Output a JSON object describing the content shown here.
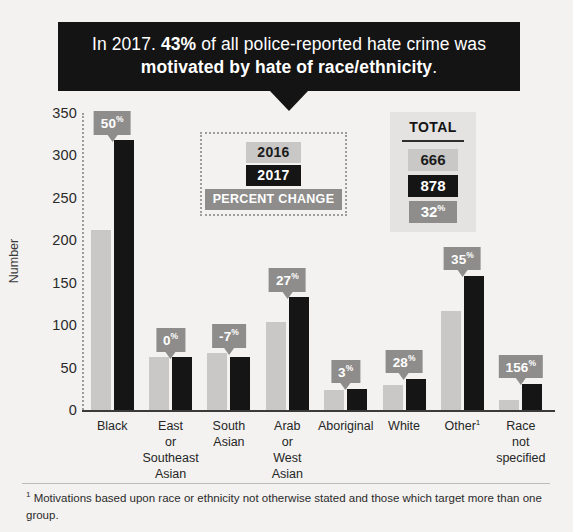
{
  "callout": {
    "part1": "In 2017. ",
    "bold1": "43%",
    "part2": " of all police-reported hate crime was ",
    "bold2": "motivated by hate of race/ethnicity",
    "part3": "."
  },
  "legend": {
    "prev_label": "2016",
    "curr_label": "2017",
    "change_label": "PERCENT CHANGE"
  },
  "total": {
    "title": "TOTAL",
    "prev": "666",
    "curr": "878",
    "change": "32",
    "change_unit": "%"
  },
  "axis": {
    "y_title": "Number",
    "y_ticks": [
      "350",
      "300",
      "250",
      "200",
      "150",
      "100",
      "50",
      "0"
    ]
  },
  "footnote": {
    "marker": "1",
    "text": " Motivations based upon race or ethnicity not otherwise stated and those which target more than one group."
  },
  "colors": {
    "prev_bar": "#c9c8c6",
    "curr_bar": "#151515",
    "change_badge": "#8e8d8b",
    "background": "#f3f2f0",
    "callout_bg": "#141414"
  },
  "chart_data": {
    "type": "bar",
    "xlabel": "",
    "ylabel": "Number",
    "ylim": [
      0,
      350
    ],
    "ytick_step": 50,
    "grid": false,
    "legend_position": "inset-center",
    "categories": [
      "Black",
      "East or Southeast Asian",
      "South Asian",
      "Arab or West Asian",
      "Aboriginal",
      "White",
      "Other¹",
      "Race not specified"
    ],
    "category_lines": [
      [
        "Black"
      ],
      [
        "East",
        "or",
        "Southeast",
        "Asian"
      ],
      [
        "South",
        "Asian"
      ],
      [
        "Arab",
        "or",
        "West",
        "Asian"
      ],
      [
        "Aboriginal"
      ],
      [
        "White"
      ],
      [
        "Other"
      ],
      [
        "Race",
        "not",
        "specified"
      ]
    ],
    "series": [
      {
        "name": "2016",
        "values": [
          212,
          62,
          67,
          104,
          24,
          29,
          117,
          12
        ]
      },
      {
        "name": "2017",
        "values": [
          318,
          62,
          62,
          133,
          25,
          37,
          158,
          31
        ]
      }
    ],
    "percent_change": [
      "50",
      "0",
      "-7",
      "27",
      "3",
      "28",
      "35",
      "156"
    ],
    "percent_unit": "%",
    "totals": {
      "2016": 666,
      "2017": 878,
      "percent_change": "32%"
    }
  }
}
